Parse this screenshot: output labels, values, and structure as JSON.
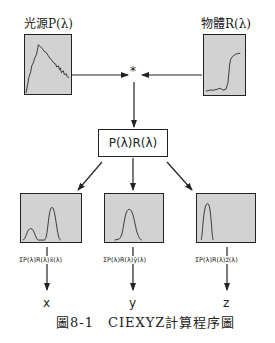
{
  "light_source": {
    "label": "光源P(λ)"
  },
  "object": {
    "label": "物體R(λ)"
  },
  "multiply_symbol": "*",
  "product_box": {
    "label": "P(λ)R(λ)"
  },
  "channels": [
    {
      "sum_label": "ΣP(λ)R(λ)x̄(λ)",
      "output": "x"
    },
    {
      "sum_label": "ΣP(λ)R(λ)ȳ(λ)",
      "output": "y"
    },
    {
      "sum_label": "ΣP(λ)R(λ)z̄(λ)",
      "output": "z"
    }
  ],
  "caption": "圖8-1　CIEXYZ計算程序圖",
  "colors": {
    "plot_fill": "#d2d2d2",
    "line": "#222222"
  }
}
